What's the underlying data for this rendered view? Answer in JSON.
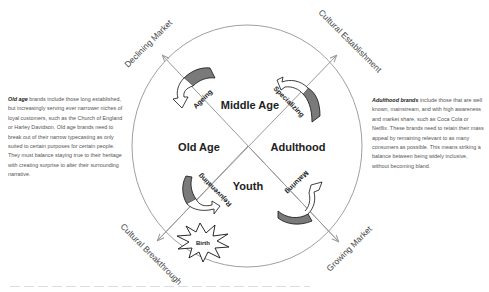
{
  "diagram": {
    "axes": {
      "top_left": "Declining Market",
      "top_right": "Cultural Establishment",
      "bottom_left": "Cultural Breakthrough",
      "bottom_right": "Growing Market"
    },
    "stages": {
      "top": "Middle Age",
      "left": "Old Age",
      "right": "Adulthood",
      "bottom": "Youth"
    },
    "transitions": {
      "ageing": "Ageing",
      "specializing": "Specializing",
      "rejuvenating": "Rejuvenating",
      "maturing": "Maturing",
      "birth": "Birth"
    },
    "colors": {
      "line": "#9a9a9a",
      "arrow_fill_dark": "#7a7a7a",
      "arrow_outline": "#111111",
      "label": "#222222"
    }
  },
  "notes": {
    "old_age": {
      "title": "Old age",
      "body": " brands include those long established, but increasingly serving ever narrower niches of loyal customers, such as the Church of England or Harley Davidson. Old age brands need to break out of their narrow typecasting as only suited to certain purposes for certain people. They must balance staying true to their heritage with creating surprise to alter their surrounding narrative."
    },
    "adulthood": {
      "title": "Adulthood brands",
      "body": " include those that are well known, mainstream, and with high awareness and market share, such as Coca Cola or Netflix. These brands need to retain their mass appeal by remaining relevant to as many consumers as possible. This means striking a balance between being widely inclusive, without becoming bland."
    }
  }
}
